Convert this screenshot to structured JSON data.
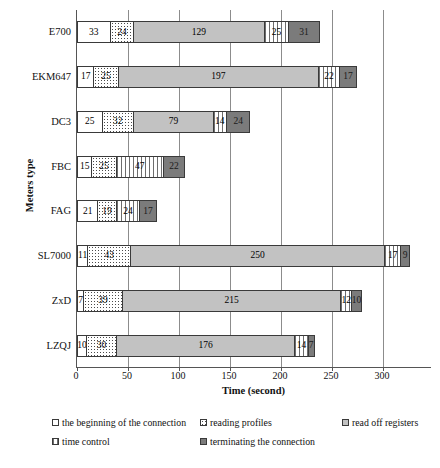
{
  "chart_data": {
    "type": "bar",
    "orientation": "horizontal",
    "stacked": true,
    "title": "",
    "xlabel": "Time (second)",
    "ylabel": "Meters type",
    "xlim": [
      0,
      348
    ],
    "xticks": [
      0,
      50,
      100,
      150,
      200,
      250,
      300
    ],
    "grid": true,
    "legend_position": "bottom",
    "categories": [
      "E700",
      "EKM647",
      "DC3",
      "FBC",
      "FAG",
      "SL7000",
      "ZxD",
      "LZQJ"
    ],
    "series": [
      {
        "name": "the beginning of the connection",
        "key": "s0",
        "color": "#ffffff",
        "pattern": "solid-white",
        "values": [
          33,
          17,
          25,
          15,
          21,
          11,
          7,
          10
        ]
      },
      {
        "name": "reading profiles",
        "key": "s1",
        "color": "#ffffff",
        "pattern": "dotted",
        "values": [
          24,
          25,
          32,
          25,
          19,
          43,
          39,
          30
        ]
      },
      {
        "name": "read off registers",
        "key": "s2",
        "color": "#c2c2c2",
        "pattern": "solid-gray",
        "values": [
          129,
          197,
          79,
          0,
          0,
          250,
          215,
          176
        ]
      },
      {
        "name": "time control",
        "key": "s3",
        "color": "#ffffff",
        "pattern": "vertical-lines",
        "values": [
          25,
          22,
          14,
          47,
          24,
          17,
          12,
          14
        ]
      },
      {
        "name": "terminating the connection",
        "key": "s4",
        "color": "#7b7b7b",
        "pattern": "solid-dark",
        "values": [
          31,
          17,
          24,
          22,
          17,
          9,
          10,
          7
        ]
      }
    ],
    "legend_entries": [
      "the beginning of the connection",
      "reading profiles",
      "read off registers",
      "time control",
      "terminating the connection"
    ]
  }
}
